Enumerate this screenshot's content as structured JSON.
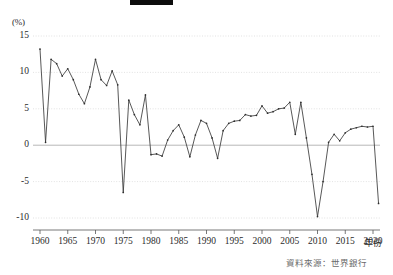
{
  "figure": {
    "title_redacted": true,
    "source_note": "資料來源：世界銀行",
    "background_color": "#ffffff",
    "line_color": "#3a3a3a",
    "grid_color": "#cfcfcf",
    "zero_line_color": "#9a9a9a",
    "axis_color": "#555555"
  },
  "axes": {
    "y_unit_label": "(%)",
    "x_axis_title": "年份",
    "y_ticks": [
      "15",
      "10",
      "5",
      "0",
      "-5",
      "-10"
    ],
    "x_ticks": [
      "1960",
      "1965",
      "1970",
      "1975",
      "1980",
      "1985",
      "1990",
      "1995",
      "2000",
      "2005",
      "2010",
      "2015",
      "2020"
    ]
  },
  "chart_data": {
    "type": "line",
    "title": "",
    "subtitle": "",
    "xlabel": "年份",
    "ylabel": "(%)",
    "xlim": [
      1960,
      2021
    ],
    "ylim": [
      -11.5,
      16
    ],
    "yticks": [
      15,
      10,
      5,
      0,
      -5,
      -10
    ],
    "xticks": [
      1960,
      1965,
      1970,
      1975,
      1980,
      1985,
      1990,
      1995,
      2000,
      2005,
      2010,
      2015,
      2020
    ],
    "grid": "horizontal-dotted",
    "legend": "none",
    "markers": true,
    "series": [
      {
        "name": "年經濟成長率",
        "x": [
          1960,
          1961,
          1962,
          1963,
          1964,
          1965,
          1966,
          1967,
          1968,
          1969,
          1970,
          1971,
          1972,
          1973,
          1974,
          1975,
          1976,
          1977,
          1978,
          1979,
          1980,
          1981,
          1982,
          1983,
          1984,
          1985,
          1986,
          1987,
          1988,
          1989,
          1990,
          1991,
          1992,
          1993,
          1994,
          1995,
          1996,
          1997,
          1998,
          1999,
          2000,
          2001,
          2002,
          2003,
          2004,
          2005,
          2006,
          2007,
          2008,
          2009,
          2010,
          2011,
          2012,
          2013,
          2014,
          2015,
          2016,
          2017,
          2018,
          2019,
          2020,
          2021
        ],
        "values": [
          13.2,
          0.4,
          11.8,
          11.2,
          9.5,
          10.5,
          9.0,
          7.0,
          5.7,
          8.0,
          11.8,
          9.0,
          8.2,
          10.2,
          8.3,
          -6.5,
          6.2,
          4.2,
          2.8,
          6.9,
          -1.3,
          -1.2,
          -1.5,
          0.7,
          2.0,
          2.8,
          1.1,
          -1.6,
          1.4,
          3.4,
          3.0,
          1.0,
          -1.8,
          2.0,
          3.0,
          3.3,
          3.4,
          4.2,
          4.0,
          4.1,
          5.4,
          4.4,
          4.6,
          5.0,
          5.1,
          5.9,
          1.5,
          5.9,
          1.0,
          -4.0,
          -9.8,
          -5.0,
          0.4,
          1.5,
          0.6,
          1.7,
          2.2,
          2.4,
          2.6,
          2.5,
          2.6,
          -8.0
        ]
      }
    ]
  }
}
